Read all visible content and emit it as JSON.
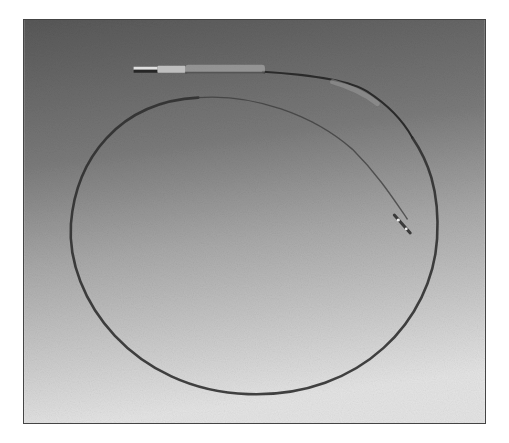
{
  "image": {
    "description": "Photograph of a coiled catheter/guidewire lying in a loop on a gray gradient background",
    "colors": {
      "background_top": "#5c5c5c",
      "background_mid": "#8e8e8e",
      "background_bottom": "#e2e2e2",
      "frame_border": "#444444",
      "wire": "#2e2e2e",
      "hub_highlight": "#d8d8d8"
    },
    "objects": [
      "catheter-hub",
      "catheter-shaft",
      "wire-loop",
      "catheter-tip"
    ]
  }
}
